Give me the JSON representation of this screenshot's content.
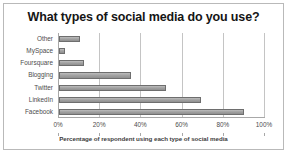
{
  "chart_data": {
    "type": "bar",
    "orientation": "horizontal",
    "title": "What types of social media do you use?",
    "xlabel": "Percentage of respondent using each type of social media",
    "ylabel": "",
    "categories": [
      "Facebook",
      "LinkedIn",
      "Twitter",
      "Blogging",
      "Foursquare",
      "MySpace",
      "Other"
    ],
    "values": [
      90,
      69,
      52,
      35,
      12,
      3,
      10
    ],
    "xlim": [
      0,
      100
    ],
    "xticks": [
      0,
      20,
      40,
      60,
      80,
      100
    ],
    "xtick_labels": [
      "0%",
      "20%",
      "40%",
      "60%",
      "80%",
      "100%"
    ],
    "grid": true,
    "legend": false,
    "bar_color": "#a3a3a3",
    "bar_edge_color": "#6e6e6e",
    "plot_background": "#ffffff",
    "border_color": "#b9b9b9"
  }
}
